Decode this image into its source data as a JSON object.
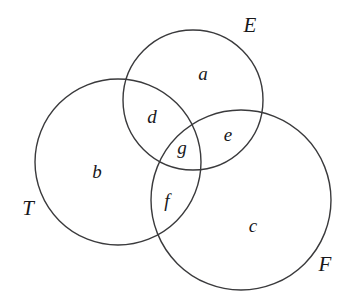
{
  "diagram": {
    "type": "venn-3-set",
    "title": "",
    "background_color": "#ffffff",
    "stroke_color": "#3a3a3c",
    "label_color": "#18181a",
    "sets": [
      {
        "key": "E",
        "label": "E",
        "label_x": 250,
        "label_y": 25,
        "cx": 193,
        "cy": 100,
        "r": 70
      },
      {
        "key": "T",
        "label": "T",
        "label_x": 28,
        "label_y": 208,
        "cx": 118,
        "cy": 162,
        "r": 83
      },
      {
        "key": "F",
        "label": "F",
        "label_x": 325,
        "label_y": 264,
        "cx": 241,
        "cy": 200,
        "r": 90
      }
    ],
    "regions": [
      {
        "key": "a",
        "label": "a",
        "x": 203,
        "y": 73,
        "meaning": "E only"
      },
      {
        "key": "d",
        "label": "d",
        "x": 152,
        "y": 116,
        "meaning": "E and T only"
      },
      {
        "key": "e",
        "label": "e",
        "x": 228,
        "y": 134,
        "meaning": "E and F only"
      },
      {
        "key": "g",
        "label": "g",
        "x": 182,
        "y": 147,
        "meaning": "E and T and F"
      },
      {
        "key": "b",
        "label": "b",
        "x": 97,
        "y": 171,
        "meaning": "T only"
      },
      {
        "key": "f",
        "label": "f",
        "x": 167,
        "y": 200,
        "meaning": "T and F only"
      },
      {
        "key": "c",
        "label": "c",
        "x": 253,
        "y": 225,
        "meaning": "F only"
      }
    ]
  }
}
